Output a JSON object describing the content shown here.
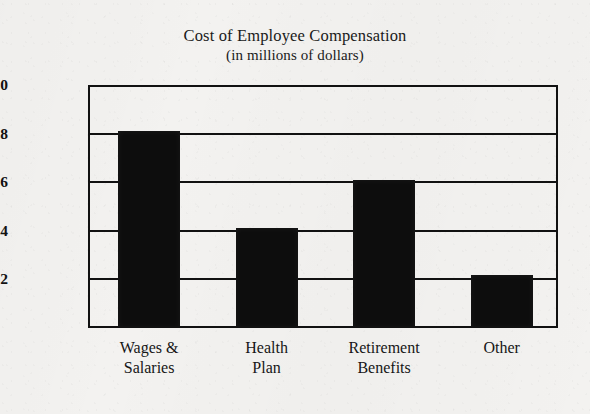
{
  "chart_data": {
    "type": "bar",
    "title": "Cost of Employee Compensation",
    "subtitle": "(in millions of dollars)",
    "xlabel": "",
    "ylabel": "",
    "categories": [
      "Wages &\nSalaries",
      "Health\nPlan",
      "Retirement\nBenefits",
      "Other"
    ],
    "values": [
      0.81,
      0.41,
      0.61,
      0.22
    ],
    "ylim": [
      0.0,
      1.0
    ],
    "ytick_labels": [
      "$1.0",
      "$0.8",
      "$0.6",
      "$0.4",
      "$0.2"
    ],
    "ytick_values": [
      1.0,
      0.8,
      0.6,
      0.4,
      0.2
    ],
    "grid": true,
    "legend": false,
    "bar_color": "#0d0d0d",
    "frame_color": "#111111",
    "background_color": "#f3f2f0"
  }
}
